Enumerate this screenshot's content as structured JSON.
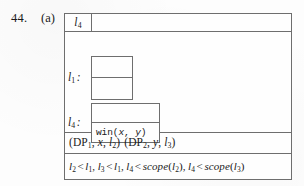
{
  "figure": {
    "item_number": "44.",
    "part_label": "(a)",
    "header": {
      "scope_label": "l",
      "scope_label_sub": "4",
      "empty_cell_value": ""
    },
    "blocks": [
      {
        "name": "block-l1",
        "label_base": "l",
        "label_sub": "1",
        "label_colon": ":",
        "cells": [
          "",
          ""
        ]
      },
      {
        "name": "block-l4",
        "label_base": "l",
        "label_sub": "4",
        "label_colon": ":",
        "cells": [
          "",
          "win(x, y)"
        ],
        "statement": {
          "callee": "win",
          "open_paren": "(",
          "arg1": "x",
          "comma": ", ",
          "arg2": "y",
          "close_paren": ")"
        }
      }
    ],
    "declarations_row": {
      "text": "(DP1, x, l2) (DP2, y, l3)",
      "items": [
        {
          "open": "(",
          "kind": "DP",
          "kind_sub": "1",
          "sep1": ", ",
          "var": "x",
          "sep2": ", ",
          "scope_base": "l",
          "scope_sub": "2",
          "close": ")"
        },
        {
          "open": "(",
          "kind": "DP",
          "kind_sub": "2",
          "sep1": ", ",
          "var": "y",
          "sep2": ", ",
          "scope_base": "l",
          "scope_sub": "3",
          "close": ")"
        }
      ]
    },
    "constraints_row": {
      "text": "l2 < l1, l3 < l1, l4 < scope(l2), l4 < scope(l3)",
      "items": [
        {
          "left_base": "l",
          "left_sub": "2",
          "operator": "<",
          "right_fn": "",
          "right_base": "l",
          "right_sub": "1",
          "trailing": ","
        },
        {
          "left_base": "l",
          "left_sub": "3",
          "operator": "<",
          "right_fn": "",
          "right_base": "l",
          "right_sub": "1",
          "trailing": ","
        },
        {
          "left_base": "l",
          "left_sub": "4",
          "operator": "<",
          "right_fn": "scope",
          "right_base": "l",
          "right_sub": "2",
          "trailing": ","
        },
        {
          "left_base": "l",
          "left_sub": "4",
          "operator": "<",
          "right_fn": "scope",
          "right_base": "l",
          "right_sub": "3",
          "trailing": ""
        }
      ]
    }
  },
  "colors": {
    "page_background": "#fdfdfd",
    "frame_background": "#fefefe",
    "rule_color": "#6e6e6e",
    "ink_color": "#1a1a1a"
  }
}
